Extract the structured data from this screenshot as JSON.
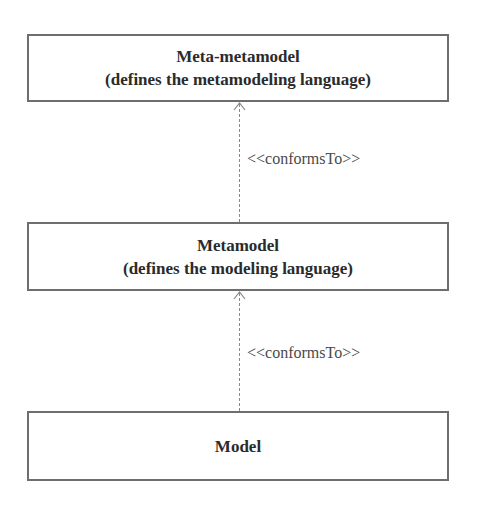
{
  "diagram": {
    "type": "metamodeling-hierarchy",
    "colors": {
      "box_border": "#6e6e6e",
      "connector": "#8a8a8a",
      "text": "#2b2b2b",
      "label_text": "#4a4a4a",
      "background": "#ffffff"
    },
    "boxes": [
      {
        "id": "meta-metamodel",
        "title": "Meta-metamodel",
        "subtitle": "(defines the metamodeling language)"
      },
      {
        "id": "metamodel",
        "title": "Metamodel",
        "subtitle": "(defines the modeling language)"
      },
      {
        "id": "model",
        "title": "Model"
      }
    ],
    "relations": [
      {
        "from": "metamodel",
        "to": "meta-metamodel",
        "label": "<<conformsTo>>",
        "style": "dashed-open-arrow"
      },
      {
        "from": "model",
        "to": "metamodel",
        "label": "<<conformsTo>>",
        "style": "dashed-open-arrow"
      }
    ]
  }
}
